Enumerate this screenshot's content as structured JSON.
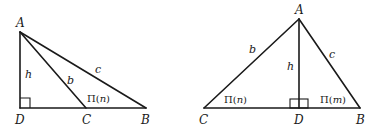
{
  "figures": [
    {
      "id": "left",
      "description": "Obtuse triangle ABC with altitude h from A dropped to extension of BC at D",
      "vertices": {
        "A": {
          "label": "A"
        },
        "B": {
          "label": "B"
        },
        "C": {
          "label": "C"
        },
        "D": {
          "label": "D"
        }
      },
      "sides": {
        "h": "h",
        "b": "b",
        "c": "c"
      },
      "angle_label": {
        "prefix": "Π(",
        "var": "n",
        "suffix": ")"
      },
      "right_angle_at": "D"
    },
    {
      "id": "right",
      "description": "Acute triangle ABC with altitude h from A to base CB at D",
      "vertices": {
        "A": {
          "label": "A"
        },
        "B": {
          "label": "B"
        },
        "C": {
          "label": "C"
        },
        "D": {
          "label": "D"
        }
      },
      "sides": {
        "h": "h",
        "b": "b",
        "c": "c"
      },
      "angle_label_C": {
        "prefix": "Π(",
        "var": "n",
        "suffix": ")"
      },
      "angle_label_B": {
        "prefix": "Π(",
        "var": "m",
        "suffix": ")"
      },
      "right_angle_at": "D"
    }
  ]
}
